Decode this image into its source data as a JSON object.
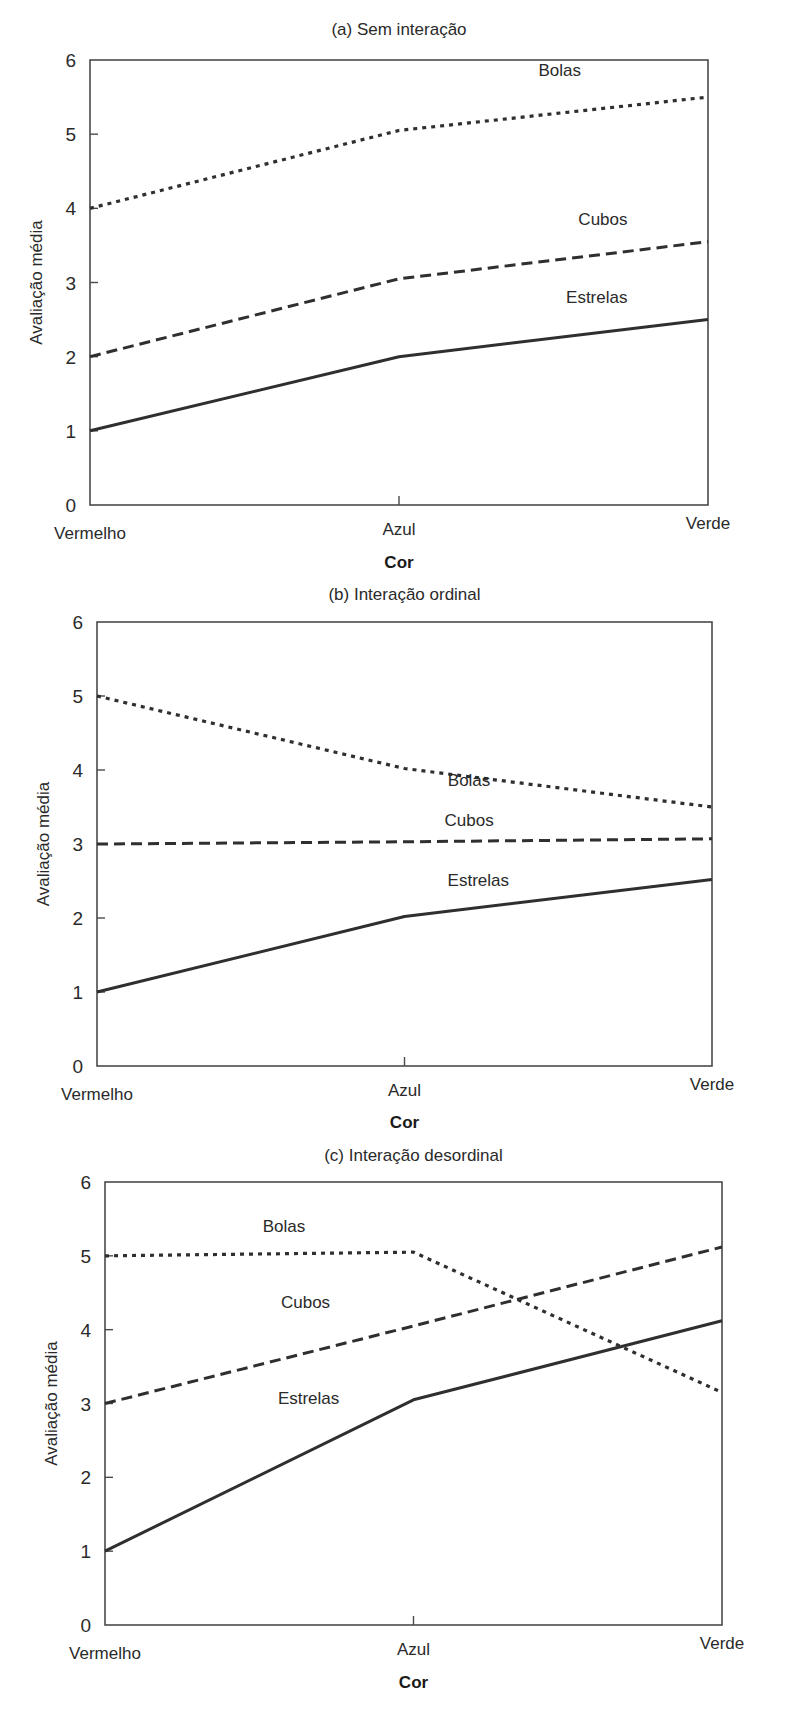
{
  "chart_data": [
    {
      "type": "line",
      "title": "(a) Sem interação",
      "xlabel": "Cor",
      "ylabel": "Avaliação média",
      "categories": [
        "Vermelho",
        "Azul",
        "Verde"
      ],
      "ylim": [
        0,
        6
      ],
      "yticks": [
        0,
        1,
        2,
        3,
        4,
        5,
        6
      ],
      "grid": false,
      "legend": "inline labels",
      "series": [
        {
          "name": "Bolas",
          "style": "dotted",
          "values": [
            4.0,
            5.05,
            5.5
          ],
          "label_pos": [
            1.52,
            5.78
          ]
        },
        {
          "name": "Cubos",
          "style": "dashed",
          "values": [
            2.0,
            3.05,
            3.55
          ],
          "label_pos": [
            1.66,
            3.78
          ]
        },
        {
          "name": "Estrelas",
          "style": "solid",
          "values": [
            1.0,
            2.0,
            2.5
          ],
          "label_pos": [
            1.64,
            2.72
          ]
        }
      ],
      "box": {
        "left": 90,
        "right": 708,
        "top": 60,
        "bottom": 505
      },
      "title_y": 35,
      "cat_y": 535,
      "xlabel_y": 568
    },
    {
      "type": "line",
      "title": "(b) Interação ordinal",
      "xlabel": "Cor",
      "ylabel": "Avaliação média",
      "categories": [
        "Vermelho",
        "Azul",
        "Verde"
      ],
      "ylim": [
        0,
        6
      ],
      "yticks": [
        0,
        1,
        2,
        3,
        4,
        5,
        6
      ],
      "grid": false,
      "legend": "inline labels",
      "series": [
        {
          "name": "Bolas",
          "style": "dotted",
          "values": [
            5.0,
            4.02,
            3.5
          ],
          "label_pos": [
            1.21,
            3.78
          ]
        },
        {
          "name": "Cubos",
          "style": "dashed",
          "values": [
            3.0,
            3.03,
            3.07
          ],
          "label_pos": [
            1.21,
            3.24
          ]
        },
        {
          "name": "Estrelas",
          "style": "solid",
          "values": [
            1.0,
            2.02,
            2.52
          ],
          "label_pos": [
            1.24,
            2.43
          ]
        }
      ],
      "box": {
        "left": 97,
        "right": 712,
        "top": 622,
        "bottom": 1066
      },
      "title_y": 600,
      "cat_y": 1096,
      "xlabel_y": 1128
    },
    {
      "type": "line",
      "title": "(c) Interação desordinal",
      "xlabel": "Cor",
      "ylabel": "Avaliação média",
      "categories": [
        "Vermelho",
        "Azul",
        "Verde"
      ],
      "ylim": [
        0,
        6
      ],
      "yticks": [
        0,
        1,
        2,
        3,
        4,
        5,
        6
      ],
      "grid": false,
      "legend": "inline labels",
      "series": [
        {
          "name": "Bolas",
          "style": "dotted",
          "values": [
            5.0,
            5.05,
            3.15
          ],
          "label_pos": [
            0.58,
            5.32
          ]
        },
        {
          "name": "Cubos",
          "style": "dashed",
          "values": [
            3.0,
            4.05,
            5.12
          ],
          "label_pos": [
            0.65,
            4.3
          ]
        },
        {
          "name": "Estrelas",
          "style": "solid",
          "values": [
            1.0,
            3.05,
            4.12
          ],
          "label_pos": [
            0.66,
            3.0
          ]
        }
      ],
      "box": {
        "left": 105,
        "right": 722,
        "top": 1182,
        "bottom": 1625
      },
      "title_y": 1161,
      "cat_y": 1655,
      "xlabel_y": 1688
    }
  ],
  "line_color": "#2f2f2f",
  "frame_color": "#4a4a4a"
}
